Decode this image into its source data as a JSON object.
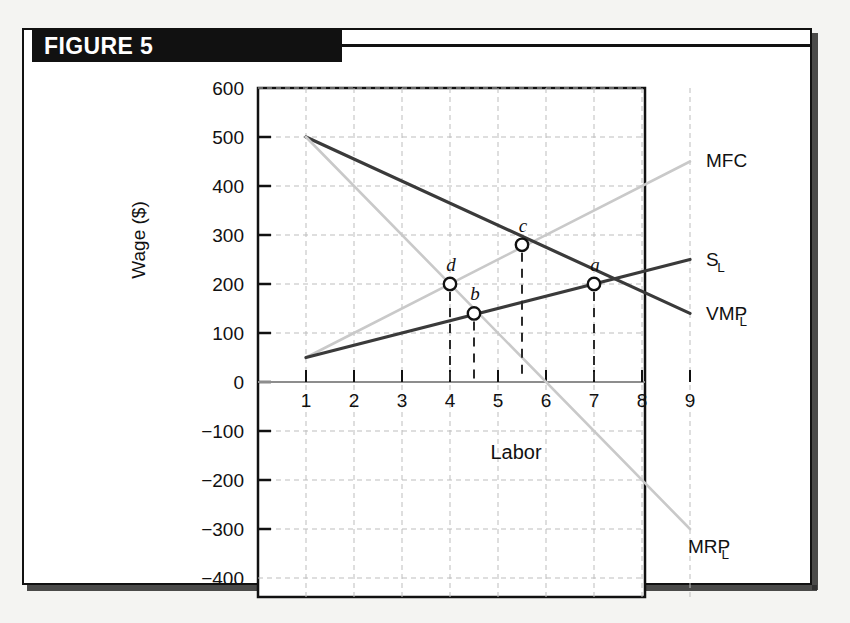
{
  "figure": {
    "title": "FIGURE 5"
  },
  "chart_data": {
    "type": "line",
    "title": "FIGURE 5",
    "xlabel": "Labor",
    "ylabel": "Wage ($)",
    "xlim": [
      0.5,
      9.5
    ],
    "ylim": [
      -400,
      600
    ],
    "xticks": [
      "1",
      "2",
      "3",
      "4",
      "5",
      "6",
      "7",
      "8",
      "9"
    ],
    "xtick_values": [
      1,
      2,
      3,
      4,
      5,
      6,
      7,
      8,
      9
    ],
    "yticks": [
      "600",
      "500",
      "400",
      "300",
      "200",
      "100",
      "0",
      "−100",
      "−200",
      "−300",
      "−400"
    ],
    "ytick_values": [
      600,
      500,
      400,
      300,
      200,
      100,
      0,
      -100,
      -200,
      -300,
      -400
    ],
    "grid": true,
    "legend_position": "right-inline",
    "series": [
      {
        "name": "MFC",
        "label": "MFC",
        "color": "#c9c9c9",
        "style": "solid",
        "points": [
          [
            1,
            50
          ],
          [
            9,
            450
          ]
        ]
      },
      {
        "name": "S_L",
        "label": "S",
        "sublabel": "L",
        "color": "#3a3a3a",
        "style": "solid",
        "points": [
          [
            1,
            50
          ],
          [
            9,
            250
          ]
        ]
      },
      {
        "name": "VMP_L",
        "label": "VMP",
        "sublabel": "L",
        "color": "#3a3a3a",
        "style": "solid",
        "points": [
          [
            1,
            500
          ],
          [
            9,
            140
          ]
        ]
      },
      {
        "name": "MRP_L",
        "label": "MRP",
        "sublabel": "L",
        "color": "#c9c9c9",
        "style": "solid",
        "points": [
          [
            1,
            500
          ],
          [
            9,
            -300
          ]
        ]
      }
    ],
    "annotations": [
      {
        "label": "a",
        "x": 7,
        "y": 200,
        "marker": "open-circle",
        "dropline": true
      },
      {
        "label": "b",
        "x": 4.5,
        "y": 140,
        "marker": "open-circle",
        "dropline": true
      },
      {
        "label": "c",
        "x": 5.5,
        "y": 280,
        "marker": "open-circle",
        "dropline": true
      },
      {
        "label": "d",
        "x": 4,
        "y": 200,
        "marker": "open-circle",
        "dropline": true
      }
    ]
  }
}
